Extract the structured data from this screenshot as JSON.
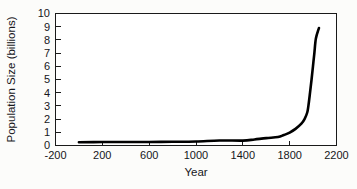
{
  "chart_data": {
    "type": "line",
    "title": "",
    "xlabel": "Year",
    "ylabel": "Population Size (billions)",
    "xlim": [
      -200,
      2200
    ],
    "ylim": [
      0,
      10
    ],
    "xticks": [
      -200,
      200,
      600,
      1000,
      1400,
      1800,
      2200
    ],
    "xtick_labels": [
      "-200",
      "200",
      "600",
      "1000",
      "1400",
      "1800",
      "2200"
    ],
    "yticks": [
      0,
      1,
      2,
      3,
      4,
      5,
      6,
      7,
      8,
      9,
      10
    ],
    "ytick_labels": [
      "0",
      "1",
      "2",
      "3",
      "4",
      "5",
      "6",
      "7",
      "8",
      "9",
      "10"
    ],
    "grid": false,
    "legend": null,
    "line_color": "#000000",
    "series": [
      {
        "name": "World population",
        "x": [
          0,
          200,
          400,
          600,
          800,
          1000,
          1200,
          1400,
          1500,
          1600,
          1700,
          1750,
          1800,
          1850,
          1900,
          1927,
          1950,
          1960,
          1974,
          1987,
          1999,
          2011,
          2024,
          2050
        ],
        "y": [
          0.25,
          0.26,
          0.26,
          0.27,
          0.28,
          0.3,
          0.38,
          0.37,
          0.46,
          0.56,
          0.64,
          0.79,
          0.98,
          1.26,
          1.65,
          2.0,
          2.5,
          3.0,
          4.0,
          5.0,
          6.0,
          7.0,
          8.1,
          8.9
        ]
      }
    ],
    "end_point": {
      "x": 2050,
      "y": 8.9
    }
  },
  "axes": {
    "x_axis_label": "Year",
    "y_axis_label": "Population Size (billions)"
  }
}
